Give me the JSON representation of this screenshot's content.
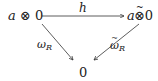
{
  "diagram": {
    "type": "commutative-triangle",
    "nodes": {
      "source": {
        "var": "a",
        "op": "⊗",
        "obj": "0",
        "text": "a ⊗ 0"
      },
      "target": {
        "var": "a",
        "op": "⊗",
        "tilde": "~",
        "obj": "0",
        "text": "a ⊗̃ 0"
      },
      "bottom": {
        "text": "0"
      }
    },
    "arrows": {
      "top": {
        "label": "h",
        "from": "source",
        "to": "target"
      },
      "left": {
        "label_base": "ω",
        "label_sub": "R",
        "from": "source",
        "to": "bottom"
      },
      "right": {
        "label_base": "ω",
        "label_tilde": "~",
        "label_sub": "R",
        "from": "target",
        "to": "bottom"
      }
    },
    "colors": {
      "stroke": "#333333",
      "text": "#222222"
    }
  }
}
